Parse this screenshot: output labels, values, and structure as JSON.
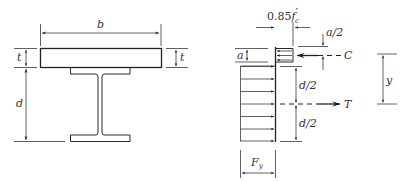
{
  "figure": {
    "section": {
      "labels": {
        "width": "b",
        "slab_thickness_left": "t",
        "slab_thickness_right": "t",
        "beam_depth": "d"
      }
    },
    "stress_diagram": {
      "labels": {
        "concrete_stress_prefix": "0.85",
        "concrete_stress_symbol": "f",
        "concrete_stress_sub": "c",
        "concrete_stress_prime": "′",
        "stress_block_depth": "a",
        "half_block_depth": "a/2",
        "compression_force": "C",
        "half_depth_upper": "d/2",
        "half_depth_lower": "d/2",
        "tension_force": "T",
        "lever_arm": "y",
        "steel_yield_symbol": "F",
        "steel_yield_sub": "y"
      }
    }
  }
}
